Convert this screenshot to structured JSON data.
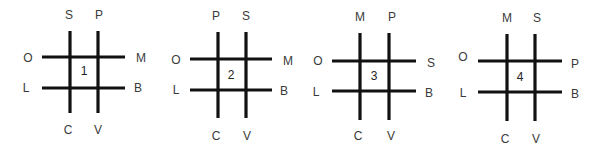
{
  "diagrams": [
    {
      "number": "1",
      "v_lines": [
        70,
        98
      ],
      "v_y": [
        31,
        113
      ],
      "h_lines": [
        57,
        88
      ],
      "h_x": [
        42,
        125
      ],
      "num_pos": [
        84,
        71
      ],
      "labels": [
        {
          "pos": "top-left",
          "text": "S",
          "x": 69,
          "y": 15
        },
        {
          "pos": "top-right",
          "text": "P",
          "x": 99,
          "y": 15
        },
        {
          "pos": "left-top",
          "text": "O",
          "x": 28,
          "y": 58
        },
        {
          "pos": "right-top",
          "text": "M",
          "x": 141,
          "y": 58
        },
        {
          "pos": "left-bottom",
          "text": "L",
          "x": 26,
          "y": 88
        },
        {
          "pos": "right-bottom",
          "text": "B",
          "x": 138,
          "y": 88
        },
        {
          "pos": "bottom-left",
          "text": "C",
          "x": 68,
          "y": 130
        },
        {
          "pos": "bottom-right",
          "text": "V",
          "x": 98,
          "y": 130
        }
      ]
    },
    {
      "number": "2",
      "v_lines": [
        218,
        246
      ],
      "v_y": [
        32,
        118
      ],
      "h_lines": [
        59,
        90
      ],
      "h_x": [
        190,
        272
      ],
      "num_pos": [
        231,
        75
      ],
      "labels": [
        {
          "pos": "top-left",
          "text": "P",
          "x": 216,
          "y": 16
        },
        {
          "pos": "top-right",
          "text": "S",
          "x": 246,
          "y": 16
        },
        {
          "pos": "left-top",
          "text": "O",
          "x": 176,
          "y": 60
        },
        {
          "pos": "right-top",
          "text": "M",
          "x": 288,
          "y": 61
        },
        {
          "pos": "left-bottom",
          "text": "L",
          "x": 176,
          "y": 90
        },
        {
          "pos": "right-bottom",
          "text": "B",
          "x": 284,
          "y": 91
        },
        {
          "pos": "bottom-left",
          "text": "C",
          "x": 216,
          "y": 136
        },
        {
          "pos": "bottom-right",
          "text": "V",
          "x": 247,
          "y": 136
        }
      ]
    },
    {
      "number": "3",
      "v_lines": [
        360,
        389
      ],
      "v_y": [
        33,
        120
      ],
      "h_lines": [
        61,
        91
      ],
      "h_x": [
        332,
        416
      ],
      "num_pos": [
        374,
        76
      ],
      "labels": [
        {
          "pos": "top-left",
          "text": "M",
          "x": 360,
          "y": 17
        },
        {
          "pos": "top-right",
          "text": "P",
          "x": 392,
          "y": 17
        },
        {
          "pos": "left-top",
          "text": "O",
          "x": 318,
          "y": 61
        },
        {
          "pos": "right-top",
          "text": "S",
          "x": 431,
          "y": 63
        },
        {
          "pos": "left-bottom",
          "text": "L",
          "x": 316,
          "y": 92
        },
        {
          "pos": "right-bottom",
          "text": "B",
          "x": 429,
          "y": 93
        },
        {
          "pos": "bottom-left",
          "text": "C",
          "x": 358,
          "y": 136
        },
        {
          "pos": "bottom-right",
          "text": "V",
          "x": 391,
          "y": 136
        }
      ]
    },
    {
      "number": "4",
      "v_lines": [
        507,
        535
      ],
      "v_y": [
        34,
        121
      ],
      "h_lines": [
        61,
        92
      ],
      "h_x": [
        478,
        562
      ],
      "num_pos": [
        520,
        77
      ],
      "labels": [
        {
          "pos": "top-left",
          "text": "M",
          "x": 507,
          "y": 18
        },
        {
          "pos": "top-right",
          "text": "S",
          "x": 537,
          "y": 18
        },
        {
          "pos": "left-top",
          "text": "O",
          "x": 463,
          "y": 57
        },
        {
          "pos": "right-top",
          "text": "P",
          "x": 575,
          "y": 64
        },
        {
          "pos": "left-bottom",
          "text": "L",
          "x": 463,
          "y": 93
        },
        {
          "pos": "right-bottom",
          "text": "B",
          "x": 575,
          "y": 94
        },
        {
          "pos": "bottom-left",
          "text": "C",
          "x": 505,
          "y": 139
        },
        {
          "pos": "bottom-right",
          "text": "V",
          "x": 536,
          "y": 139
        }
      ]
    }
  ],
  "colors": {
    "line": "#111111",
    "label": "#3a3a3a",
    "background": "#ffffff"
  }
}
